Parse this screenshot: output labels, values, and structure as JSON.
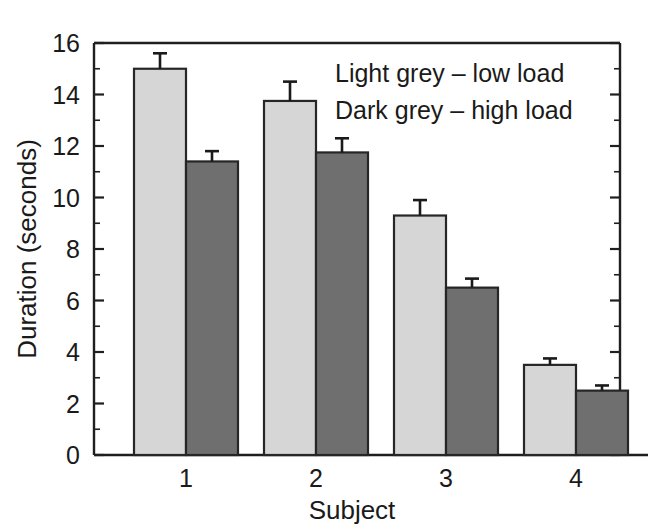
{
  "chart_data": {
    "type": "bar",
    "title": "",
    "xlabel": "Subject",
    "ylabel": "Duration (seconds)",
    "categories": [
      "1",
      "2",
      "3",
      "4"
    ],
    "ylim": [
      0,
      16
    ],
    "ytick_labels": [
      "0",
      "2",
      "4",
      "6",
      "8",
      "10",
      "12",
      "14",
      "16"
    ],
    "ytick_values": [
      0,
      2,
      4,
      6,
      8,
      10,
      12,
      14,
      16
    ],
    "yminor_step": 1,
    "grid": false,
    "legend_position": "top-right",
    "series": [
      {
        "name": "Light grey – low load",
        "color": "#d6d6d6",
        "values": [
          15.0,
          13.75,
          9.3,
          3.5
        ],
        "errors": [
          0.6,
          0.75,
          0.6,
          0.25
        ]
      },
      {
        "name": "Dark grey – high load",
        "color": "#6f6f6f",
        "values": [
          11.4,
          11.75,
          6.5,
          2.5
        ],
        "errors": [
          0.4,
          0.55,
          0.35,
          0.2
        ]
      }
    ],
    "legend_entries": [
      "Light grey – low load",
      "Dark grey – high load"
    ]
  },
  "colors": {
    "light_grey": "#d6d6d6",
    "dark_grey": "#6f6f6f",
    "axis": "#1f1f1f",
    "background": "#ffffff"
  },
  "axis": {
    "y_title": "Duration (seconds)",
    "x_title": "Subject"
  }
}
